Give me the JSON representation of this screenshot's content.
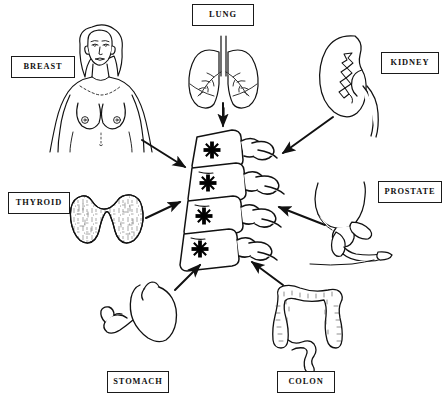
{
  "diagram": {
    "center": {
      "name": "Spine (vertebrae) with metastatic lesions",
      "lesion_marker": "black-asterisk",
      "lesion_count": 4,
      "vertebra_count": 4
    },
    "stroke_color": "#111111",
    "fill_color": "#ffffff",
    "lesion_color": "#000000",
    "labels": [
      {
        "id": "breast",
        "text": "BREAST",
        "organ": "female-torso-breast",
        "position": "top-left"
      },
      {
        "id": "lung",
        "text": "LUNG",
        "organ": "lungs-with-trachea",
        "position": "top-center"
      },
      {
        "id": "kidney",
        "text": "KIDNEY",
        "organ": "kidney",
        "position": "top-right"
      },
      {
        "id": "prostate",
        "text": "PROSTATE",
        "organ": "prostate-bladder",
        "position": "right"
      },
      {
        "id": "colon",
        "text": "COLON",
        "organ": "large-intestine",
        "position": "bottom-right"
      },
      {
        "id": "stomach",
        "text": "STOMACH",
        "organ": "stomach",
        "position": "bottom-left"
      },
      {
        "id": "thyroid",
        "text": "THYROID",
        "organ": "thyroid-gland",
        "position": "left"
      }
    ],
    "arrows": [
      {
        "from": "breast",
        "to": "spine",
        "direction": "down-right"
      },
      {
        "from": "lung",
        "to": "spine",
        "direction": "down"
      },
      {
        "from": "kidney",
        "to": "spine",
        "direction": "down-left"
      },
      {
        "from": "prostate",
        "to": "spine",
        "direction": "left"
      },
      {
        "from": "colon",
        "to": "spine",
        "direction": "up-left"
      },
      {
        "from": "stomach",
        "to": "spine",
        "direction": "up-right"
      },
      {
        "from": "thyroid",
        "to": "spine",
        "direction": "up-right"
      }
    ],
    "arrow_count": 7
  }
}
